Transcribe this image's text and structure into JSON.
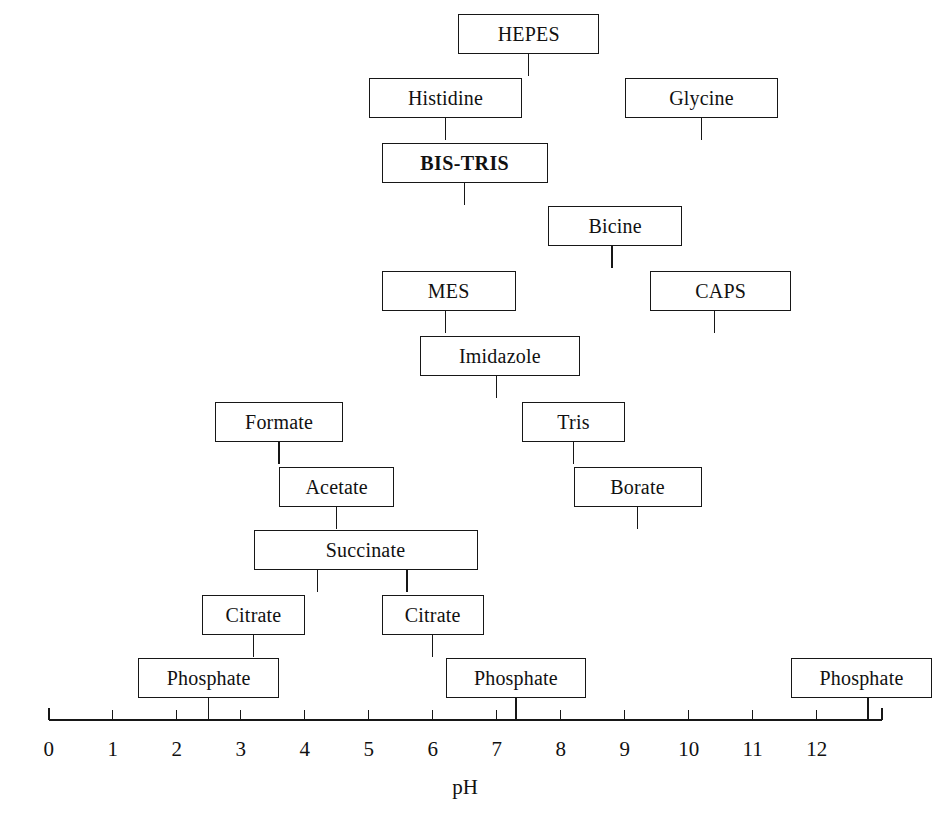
{
  "figure": {
    "axis_title": "pH",
    "axis_ticks": [
      {
        "label": "0",
        "value": 0
      },
      {
        "label": "1",
        "value": 1
      },
      {
        "label": "2",
        "value": 2
      },
      {
        "label": "3",
        "value": 3
      },
      {
        "label": "4",
        "value": 4
      },
      {
        "label": "5",
        "value": 5
      },
      {
        "label": "6",
        "value": 6
      },
      {
        "label": "7",
        "value": 7
      },
      {
        "label": "8",
        "value": 8
      },
      {
        "label": "9",
        "value": 9
      },
      {
        "label": "10",
        "value": 10
      },
      {
        "label": "11",
        "value": 11
      },
      {
        "label": "12",
        "value": 12
      }
    ]
  },
  "chart_data": {
    "type": "table",
    "title": "",
    "xlabel": "pH",
    "ylabel": "",
    "xlim": [
      0,
      13.0
    ],
    "grid": false,
    "legend": "none",
    "note": "Buffer useful-pH-range chart: each labelled box spans the pH interval over which that buffer is useful; the short vertical stems below each box mark its pKa value(s) on the pH axis.",
    "categories": [
      "HEPES",
      "Histidine",
      "Glycine",
      "BIS-TRIS",
      "Bicine",
      "MES",
      "CAPS",
      "Imidazole",
      "Formate",
      "Tris",
      "Acetate",
      "Borate",
      "Succinate",
      "Citrate",
      "Citrate",
      "Phosphate",
      "Phosphate",
      "Phosphate"
    ],
    "items": [
      {
        "label": "HEPES",
        "row": 0,
        "ph_start": 6.4,
        "ph_end": 8.6,
        "pka": [
          7.5
        ],
        "bold": false
      },
      {
        "label": "Histidine",
        "row": 1,
        "ph_start": 5.0,
        "ph_end": 7.4,
        "pka": [
          6.2
        ],
        "bold": false
      },
      {
        "label": "Glycine",
        "row": 1,
        "ph_start": 9.0,
        "ph_end": 11.4,
        "pka": [
          10.2
        ],
        "bold": false
      },
      {
        "label": "BIS-TRIS",
        "row": 2,
        "ph_start": 5.2,
        "ph_end": 7.8,
        "pka": [
          6.5
        ],
        "bold": true
      },
      {
        "label": "Bicine",
        "row": 3,
        "ph_start": 7.8,
        "ph_end": 9.9,
        "pka": [
          8.8
        ],
        "bold": false
      },
      {
        "label": "MES",
        "row": 4,
        "ph_start": 5.2,
        "ph_end": 7.3,
        "pka": [
          6.2
        ],
        "bold": false
      },
      {
        "label": "CAPS",
        "row": 4,
        "ph_start": 9.4,
        "ph_end": 11.6,
        "pka": [
          10.4
        ],
        "bold": false
      },
      {
        "label": "Imidazole",
        "row": 5,
        "ph_start": 5.8,
        "ph_end": 8.3,
        "pka": [
          7.0
        ],
        "bold": false
      },
      {
        "label": "Formate",
        "row": 6,
        "ph_start": 2.6,
        "ph_end": 4.6,
        "pka": [
          3.6
        ],
        "bold": false
      },
      {
        "label": "Tris",
        "row": 6,
        "ph_start": 7.4,
        "ph_end": 9.0,
        "pka": [
          8.2
        ],
        "bold": false
      },
      {
        "label": "Acetate",
        "row": 7,
        "ph_start": 3.6,
        "ph_end": 5.4,
        "pka": [
          4.5
        ],
        "bold": false
      },
      {
        "label": "Borate",
        "row": 7,
        "ph_start": 8.2,
        "ph_end": 10.2,
        "pka": [
          9.2
        ],
        "bold": false
      },
      {
        "label": "Succinate",
        "row": 8,
        "ph_start": 3.2,
        "ph_end": 6.7,
        "pka": [
          4.2,
          5.6
        ],
        "bold": false
      },
      {
        "label": "Citrate",
        "row": 9,
        "ph_start": 2.4,
        "ph_end": 4.0,
        "pka": [
          3.2
        ],
        "bold": false
      },
      {
        "label": "Citrate",
        "row": 9,
        "ph_start": 5.2,
        "ph_end": 6.8,
        "pka": [
          6.0
        ],
        "bold": false
      },
      {
        "label": "Phosphate",
        "row": 10,
        "ph_start": 1.4,
        "ph_end": 3.6,
        "pka": [
          2.5
        ],
        "bold": false
      },
      {
        "label": "Phosphate",
        "row": 10,
        "ph_start": 6.2,
        "ph_end": 8.4,
        "pka": [
          7.3
        ],
        "bold": false
      },
      {
        "label": "Phosphate",
        "row": 10,
        "ph_start": 11.6,
        "ph_end": 13.8,
        "pka": [
          12.8
        ],
        "bold": false
      }
    ]
  }
}
